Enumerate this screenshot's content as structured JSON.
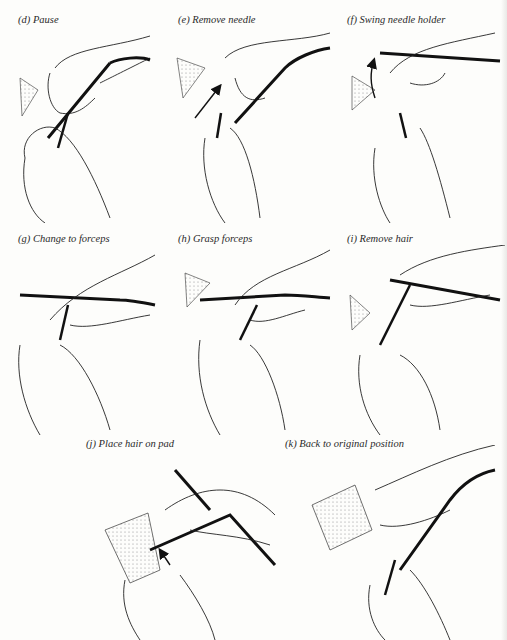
{
  "figure": {
    "panels": [
      {
        "id": "d",
        "label": "(d)",
        "caption": "Pause"
      },
      {
        "id": "e",
        "label": "(e)",
        "caption": "Remove needle"
      },
      {
        "id": "f",
        "label": "(f)",
        "caption": "Swing needle holder"
      },
      {
        "id": "g",
        "label": "(g)",
        "caption": "Change to forceps"
      },
      {
        "id": "h",
        "label": "(h)",
        "caption": "Grasp forceps"
      },
      {
        "id": "i",
        "label": "(i)",
        "caption": "Remove hair"
      },
      {
        "id": "j",
        "label": "(j)",
        "caption": "Place hair on pad"
      },
      {
        "id": "k",
        "label": "(k)",
        "caption": "Back to original position"
      }
    ]
  },
  "icons": {
    "arrow": "arrow-icon",
    "pad": "dotted-pad-icon",
    "hand": "hand-illustration",
    "needle_holder": "needle-holder-icon",
    "forceps": "forceps-icon"
  }
}
